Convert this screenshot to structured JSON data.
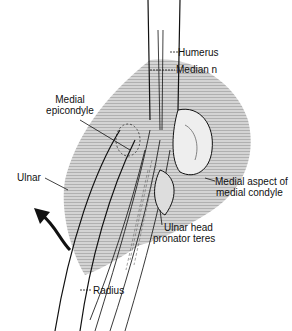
{
  "figure": {
    "labels": {
      "humerus": "Humerus",
      "median_n": "Median n",
      "medial_epicondyle_1": "Medial",
      "medial_epicondyle_2": "epicondyle",
      "ulnar": "Ulnar",
      "medial_aspect_1": "Medial aspect of",
      "medial_aspect_2": "medial condyle",
      "ulnar_head_1": "Ulnar head",
      "ulnar_head_2": "pronator teres",
      "radius": "Radius"
    },
    "colors": {
      "ink": "#111111",
      "shade": "#c8c8c8",
      "background": "#ffffff"
    }
  }
}
